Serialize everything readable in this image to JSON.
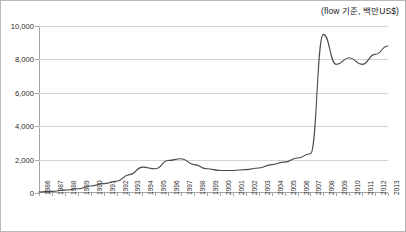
{
  "caption": {
    "unit_note": "(flow 기준, 백만US$)"
  },
  "chart_data": {
    "type": "line",
    "title": "",
    "subtitle": "",
    "xlabel": "",
    "ylabel": "",
    "unit_note": "(flow 기준, 백만US$)",
    "grid": true,
    "legend": "none",
    "line_color": "#4a4a4a",
    "gridline_color": "#d4d4d4",
    "axis_color": "#a6a6a6",
    "ylim": [
      0,
      10000
    ],
    "ytick_values": [
      0,
      2000,
      4000,
      6000,
      8000,
      10000
    ],
    "ytick_labels": [
      "0",
      "2,000",
      "4,000",
      "6,000",
      "8,000",
      "10,000"
    ],
    "categories": [
      "1986",
      "1987",
      "1988",
      "1989",
      "1990",
      "1991",
      "1992",
      "1993",
      "1994",
      "1995",
      "1996",
      "1997",
      "1998",
      "1999",
      "2000",
      "2001",
      "2002",
      "2003",
      "2004",
      "2005",
      "2006",
      "2007",
      "2008",
      "2009",
      "2010",
      "2011",
      "2012",
      "2013"
    ],
    "values": [
      60,
      100,
      170,
      250,
      420,
      560,
      700,
      1100,
      1550,
      1450,
      1950,
      2050,
      1700,
      1450,
      1350,
      1350,
      1400,
      1500,
      1700,
      1850,
      2100,
      2350,
      9500,
      7700,
      8100,
      7700,
      8300,
      8800
    ],
    "series": [
      {
        "name": "flow",
        "values": [
          60,
          100,
          170,
          250,
          420,
          560,
          700,
          1100,
          1550,
          1450,
          1950,
          2050,
          1700,
          1450,
          1350,
          1350,
          1400,
          1500,
          1700,
          1850,
          2100,
          2350,
          9500,
          7700,
          8100,
          7700,
          8300,
          8800
        ]
      }
    ],
    "annotations": []
  }
}
